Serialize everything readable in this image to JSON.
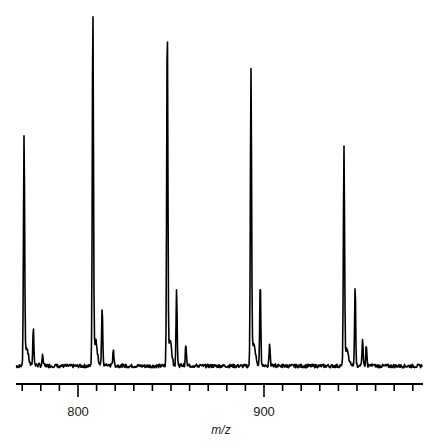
{
  "chart_data": {
    "type": "line",
    "title": "",
    "xlabel": "m/z",
    "ylabel": "",
    "xlim": [
      769,
      988
    ],
    "x_ticks_major": [
      800,
      900
    ],
    "x_tick_labels": [
      "800",
      "900"
    ],
    "x_minor_tick_step": 10,
    "grid": false,
    "legend": null,
    "y_axis_visible": false,
    "line_color": "#000000",
    "peaks": [
      {
        "mz": 771,
        "relative_intensity": 65,
        "satellites": [
          {
            "mz": 776,
            "relative_intensity": 11
          },
          {
            "mz": 781,
            "relative_intensity": 3
          }
        ]
      },
      {
        "mz": 808,
        "relative_intensity": 100,
        "satellites": [
          {
            "mz": 813,
            "relative_intensity": 17
          },
          {
            "mz": 819,
            "relative_intensity": 5
          }
        ]
      },
      {
        "mz": 848,
        "relative_intensity": 97,
        "satellites": [
          {
            "mz": 853,
            "relative_intensity": 22
          },
          {
            "mz": 858,
            "relative_intensity": 6
          }
        ]
      },
      {
        "mz": 893,
        "relative_intensity": 84,
        "satellites": [
          {
            "mz": 898,
            "relative_intensity": 24
          },
          {
            "mz": 903,
            "relative_intensity": 6
          }
        ]
      },
      {
        "mz": 943,
        "relative_intensity": 61,
        "satellites": [
          {
            "mz": 949,
            "relative_intensity": 23
          },
          {
            "mz": 953,
            "relative_intensity": 7
          },
          {
            "mz": 955,
            "relative_intensity": 6
          }
        ]
      }
    ]
  },
  "axis": {
    "label": "m/z",
    "tick_800": "800",
    "tick_900": "900"
  }
}
